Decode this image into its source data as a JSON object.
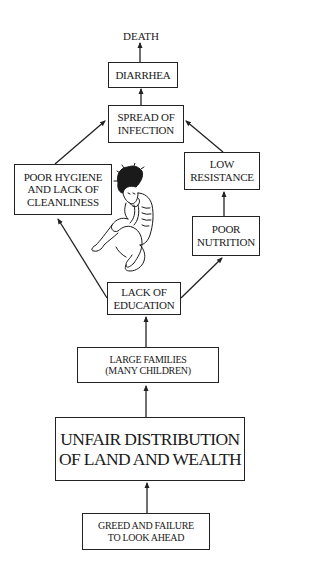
{
  "diagram": {
    "nodes": {
      "death": "DEATH",
      "diarrhea": "DIARRHEA",
      "spread": "SPREAD OF\nINFECTION",
      "hygiene": "POOR HYGIENE\nAND LACK OF\nCLEANLINESS",
      "resistance": "LOW\nRESISTANCE",
      "nutrition": "POOR\nNUTRITION",
      "education": "LACK OF\nEDUCATION",
      "families": "LARGE FAMILIES\n(MANY CHILDREN)",
      "unfair": "UNFAIR DISTRIBUTION\nOF LAND AND WEALTH",
      "greed": "GREED AND FAILURE\nTO LOOK AHEAD"
    },
    "edges": [
      {
        "from": "greed",
        "to": "unfair"
      },
      {
        "from": "unfair",
        "to": "families"
      },
      {
        "from": "families",
        "to": "education"
      },
      {
        "from": "education",
        "to": "hygiene"
      },
      {
        "from": "education",
        "to": "nutrition"
      },
      {
        "from": "nutrition",
        "to": "resistance"
      },
      {
        "from": "hygiene",
        "to": "spread"
      },
      {
        "from": "resistance",
        "to": "spread"
      },
      {
        "from": "spread",
        "to": "diarrhea"
      },
      {
        "from": "diarrhea",
        "to": "death"
      }
    ],
    "illustration": "sick-emaciated-child"
  }
}
